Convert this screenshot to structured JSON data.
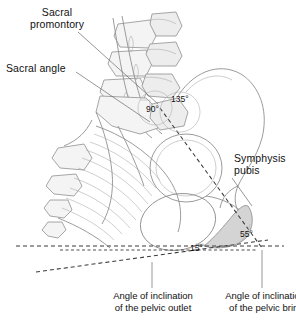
{
  "figure": {
    "background": "#ffffff",
    "line_color": "#8a8a8a",
    "dark_line_color": "#4a4a4a",
    "bone_fill": "#f2f2f2",
    "shade_fill": "#d6d6d6",
    "leader_color": "#555555"
  },
  "labels": {
    "sacral_promontory": "Sacral\npromontory",
    "sacral_angle": "Sacral angle",
    "symphysis_pubis": "Symphysis\npubis"
  },
  "angles": {
    "right_angle": "90°",
    "sacral": "135°",
    "brim": "55°",
    "outlet": "15°"
  },
  "captions": {
    "outlet": "Angle of inclination\nof the pelvic outlet",
    "brim": "Angle of inclination\nof the pelvic brim"
  }
}
